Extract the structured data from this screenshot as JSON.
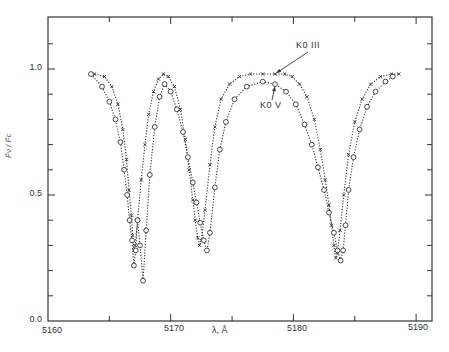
{
  "chart_data": {
    "type": "line",
    "title": "",
    "xlabel": "λ, Å",
    "ylabel": "F̄ν / F̄c",
    "xlim": [
      5160,
      5191.3
    ],
    "ylim": [
      0.0,
      1.2
    ],
    "xticks": [
      5160,
      5170,
      5180,
      5190
    ],
    "xtick_labels": [
      "5160",
      "5170",
      "5180",
      "5190"
    ],
    "xminor": [
      5165,
      5175,
      5185
    ],
    "yticks": [
      0.0,
      0.5,
      1.0
    ],
    "ytick_labels": [
      "0.0",
      "0.5",
      "1.0"
    ],
    "yminor": [
      0.1,
      0.2,
      0.3,
      0.4,
      0.6,
      0.7,
      0.8,
      0.9,
      1.1
    ],
    "grid": false,
    "legend_position": "annotations with arrows",
    "series": [
      {
        "name": "K0 III",
        "marker": "x",
        "linestyle": "dotted",
        "x": [
          5163.8,
          5164.6,
          5165.2,
          5165.7,
          5166.1,
          5166.4,
          5166.6,
          5166.8,
          5166.9,
          5167.0,
          5167.1,
          5167.3,
          5167.6,
          5167.9,
          5168.2,
          5168.6,
          5169.0,
          5169.4,
          5169.8,
          5170.3,
          5170.8,
          5171.2,
          5171.5,
          5171.8,
          5172.0,
          5172.2,
          5172.35,
          5172.5,
          5172.8,
          5173.2,
          5173.6,
          5174.1,
          5174.8,
          5175.6,
          5176.5,
          5177.5,
          5178.5,
          5179.3,
          5179.9,
          5180.5,
          5181.1,
          5181.7,
          5182.2,
          5182.6,
          5182.9,
          5183.1,
          5183.3,
          5183.45,
          5183.6,
          5183.8,
          5184.1,
          5184.5,
          5185.0,
          5185.6,
          5186.3,
          5187.1,
          5188.0,
          5188.6
        ],
        "values": [
          0.98,
          0.97,
          0.93,
          0.86,
          0.76,
          0.64,
          0.52,
          0.42,
          0.34,
          0.28,
          0.3,
          0.4,
          0.56,
          0.7,
          0.82,
          0.91,
          0.96,
          0.98,
          0.97,
          0.93,
          0.84,
          0.72,
          0.6,
          0.48,
          0.4,
          0.33,
          0.3,
          0.32,
          0.44,
          0.62,
          0.77,
          0.88,
          0.94,
          0.97,
          0.98,
          0.98,
          0.98,
          0.98,
          0.97,
          0.94,
          0.89,
          0.8,
          0.68,
          0.56,
          0.46,
          0.38,
          0.3,
          0.25,
          0.27,
          0.36,
          0.5,
          0.66,
          0.79,
          0.88,
          0.94,
          0.97,
          0.98,
          0.98
        ]
      },
      {
        "name": "K0 V",
        "marker": "o",
        "linestyle": "dotted",
        "x": [
          5163.5,
          5164.4,
          5165.0,
          5165.5,
          5165.9,
          5166.2,
          5166.45,
          5166.65,
          5166.85,
          5167.0,
          5167.15,
          5167.3,
          5167.5,
          5167.75,
          5168.0,
          5168.3,
          5168.7,
          5169.1,
          5169.5,
          5170.0,
          5170.5,
          5171.0,
          5171.4,
          5171.8,
          5172.1,
          5172.4,
          5172.7,
          5172.95,
          5173.2,
          5173.6,
          5174.0,
          5174.5,
          5175.2,
          5176.2,
          5177.5,
          5178.5,
          5179.4,
          5180.2,
          5180.9,
          5181.5,
          5182.0,
          5182.5,
          5182.9,
          5183.3,
          5183.6,
          5183.85,
          5184.05,
          5184.25,
          5184.5,
          5184.9,
          5185.4,
          5186.0,
          5186.7,
          5187.5,
          5188.1
        ],
        "values": [
          0.98,
          0.93,
          0.87,
          0.8,
          0.71,
          0.6,
          0.5,
          0.4,
          0.32,
          0.22,
          0.28,
          0.4,
          0.3,
          0.16,
          0.36,
          0.58,
          0.77,
          0.89,
          0.94,
          0.91,
          0.84,
          0.75,
          0.65,
          0.55,
          0.47,
          0.39,
          0.32,
          0.28,
          0.35,
          0.53,
          0.68,
          0.79,
          0.88,
          0.93,
          0.95,
          0.94,
          0.91,
          0.86,
          0.78,
          0.7,
          0.61,
          0.52,
          0.43,
          0.35,
          0.28,
          0.24,
          0.28,
          0.38,
          0.52,
          0.65,
          0.76,
          0.85,
          0.91,
          0.95,
          0.97
        ]
      }
    ],
    "annotations": [
      {
        "text": "K0 III",
        "points_to": [
          5177.8,
          0.98
        ]
      },
      {
        "text": "K0 V",
        "points_to": [
          5177.6,
          0.95
        ]
      }
    ]
  },
  "labels": {
    "ytick_0": "0.0",
    "ytick_05": "0.5",
    "ytick_1": "1.0",
    "xtick_5160": "5160",
    "xtick_5170": "5170",
    "xtick_5180": "5180",
    "xtick_5190": "5190",
    "xlabel": "λ, Å",
    "ylabel": "F̄ν / F̄c",
    "legend_k0iii": "K0 III",
    "legend_k0v": "K0 V"
  }
}
